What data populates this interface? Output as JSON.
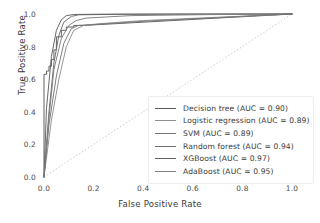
{
  "chart_data": {
    "type": "line",
    "title": "",
    "xlabel": "False Positive Rate",
    "ylabel": "True Positive Rate",
    "xlim": [
      0.0,
      1.0
    ],
    "ylim": [
      0.0,
      1.0
    ],
    "xticks": [
      "0.0",
      "0.2",
      "0.4",
      "0.6",
      "0.8",
      "1.0"
    ],
    "yticks": [
      "0.0",
      "0.2",
      "0.4",
      "0.6",
      "0.8",
      "1.0"
    ],
    "xtick_values": [
      0.0,
      0.2,
      0.4,
      0.6,
      0.8,
      1.0
    ],
    "ytick_values": [
      0.0,
      0.2,
      0.4,
      0.6,
      0.8,
      1.0
    ],
    "grid": false,
    "legend_position": "lower right",
    "reference_line": {
      "name": "chance-diagonal",
      "x": [
        0.0,
        1.0
      ],
      "y": [
        0.0,
        1.0
      ],
      "style": "dotted",
      "color": "#cccccc"
    },
    "series": [
      {
        "name": "Decision tree",
        "auc": "0.90",
        "label": "Decision tree (AUC = 0.90)",
        "color": "#5a5a5a",
        "drawstyle": "steps-post",
        "x": [
          0.0,
          0.0,
          0.01,
          0.01,
          0.02,
          0.02,
          0.03,
          0.03,
          0.04,
          0.04,
          0.05,
          0.05,
          0.07,
          0.07,
          0.09,
          0.09,
          0.12,
          0.12,
          0.16,
          0.16,
          1.0
        ],
        "y": [
          0.0,
          0.63,
          0.63,
          0.65,
          0.65,
          0.68,
          0.68,
          0.72,
          0.72,
          0.78,
          0.78,
          0.86,
          0.86,
          0.9,
          0.9,
          0.92,
          0.92,
          0.93,
          0.93,
          0.93,
          1.0
        ]
      },
      {
        "name": "Logistic regression",
        "auc": "0.89",
        "label": "Logistic regression (AUC = 0.89)",
        "color": "#8f8f8f",
        "drawstyle": "default",
        "x": [
          0.0,
          0.03,
          0.06,
          0.09,
          0.12,
          0.16,
          0.22,
          0.4,
          0.7,
          1.0
        ],
        "y": [
          0.0,
          0.35,
          0.6,
          0.8,
          0.9,
          0.93,
          0.94,
          0.96,
          0.98,
          1.0
        ]
      },
      {
        "name": "SVM",
        "auc": "0.89",
        "label": "SVM (AUC = 0.89)",
        "color": "#767676",
        "drawstyle": "default",
        "x": [
          0.0,
          0.02,
          0.05,
          0.08,
          0.11,
          0.14,
          0.2,
          0.4,
          0.7,
          1.0
        ],
        "y": [
          0.0,
          0.32,
          0.62,
          0.82,
          0.91,
          0.93,
          0.935,
          0.955,
          0.978,
          1.0
        ]
      },
      {
        "name": "Random forest",
        "auc": "0.94",
        "label": "Random forest (AUC = 0.94)",
        "color": "#6b6b6b",
        "drawstyle": "default",
        "x": [
          0.0,
          0.02,
          0.04,
          0.06,
          0.08,
          0.11,
          0.14,
          0.3,
          0.6,
          1.0
        ],
        "y": [
          0.0,
          0.4,
          0.7,
          0.87,
          0.95,
          0.985,
          0.995,
          0.998,
          0.999,
          1.0
        ]
      },
      {
        "name": "XGBoost",
        "auc": "0.97",
        "label": "XGBoost (AUC = 0.97)",
        "color": "#606060",
        "drawstyle": "default",
        "x": [
          0.0,
          0.01,
          0.03,
          0.05,
          0.07,
          0.09,
          0.12,
          0.25,
          0.55,
          1.0
        ],
        "y": [
          0.0,
          0.42,
          0.74,
          0.9,
          0.965,
          0.99,
          0.997,
          0.999,
          1.0,
          1.0
        ]
      },
      {
        "name": "AdaBoost",
        "auc": "0.95",
        "label": "AdaBoost (AUC = 0.95)",
        "color": "#7d7d7d",
        "drawstyle": "default",
        "x": [
          0.0,
          0.02,
          0.04,
          0.07,
          0.1,
          0.13,
          0.17,
          0.35,
          0.65,
          1.0
        ],
        "y": [
          0.0,
          0.36,
          0.66,
          0.85,
          0.93,
          0.96,
          0.975,
          0.99,
          0.996,
          1.0
        ]
      }
    ]
  }
}
